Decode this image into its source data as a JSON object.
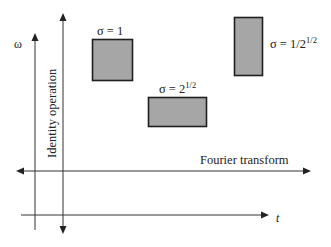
{
  "diagram": {
    "type": "time-frequency-plane",
    "axes": {
      "vertical_label": "ω",
      "horizontal_label": "t"
    },
    "operations": {
      "identity": "Identity operation",
      "fourier": "Fourier transform"
    },
    "tiles": [
      {
        "id": "sigma-1",
        "label_prefix": "σ = 1",
        "label_sup": "",
        "fill": "#a6a6a6"
      },
      {
        "id": "sigma-sqrt2",
        "label_prefix": "σ = 2",
        "label_sup": "1/2",
        "fill": "#a6a6a6"
      },
      {
        "id": "sigma-inv-sqrt2",
        "label_prefix": "σ = 1/2",
        "label_sup": "1/2",
        "fill": "#a6a6a6"
      }
    ]
  }
}
